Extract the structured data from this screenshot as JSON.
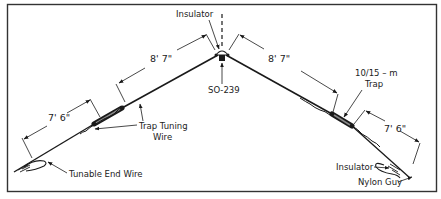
{
  "diagram": {
    "type": "inverted-V trap dipole antenna",
    "labels": {
      "center_insulator": "Insulator",
      "connector": "SO-239",
      "trap_tuning_wire_line1": "Trap Tuning",
      "trap_tuning_wire_line2": "Wire",
      "tunable_end_wire": "Tunable End Wire",
      "trap_line1": "10/15 – m",
      "trap_line2": "Trap",
      "end_insulator": "Insulator",
      "nylon_guy": "Nylon Guy"
    },
    "dimensions": {
      "left_inner": "8' 7\"",
      "left_outer": "7' 6\"",
      "right_inner": "8' 7\"",
      "right_outer": "7' 6\""
    },
    "colors": {
      "line": "#1a1a1a",
      "background": "#ffffff",
      "frame": "#333333"
    }
  }
}
